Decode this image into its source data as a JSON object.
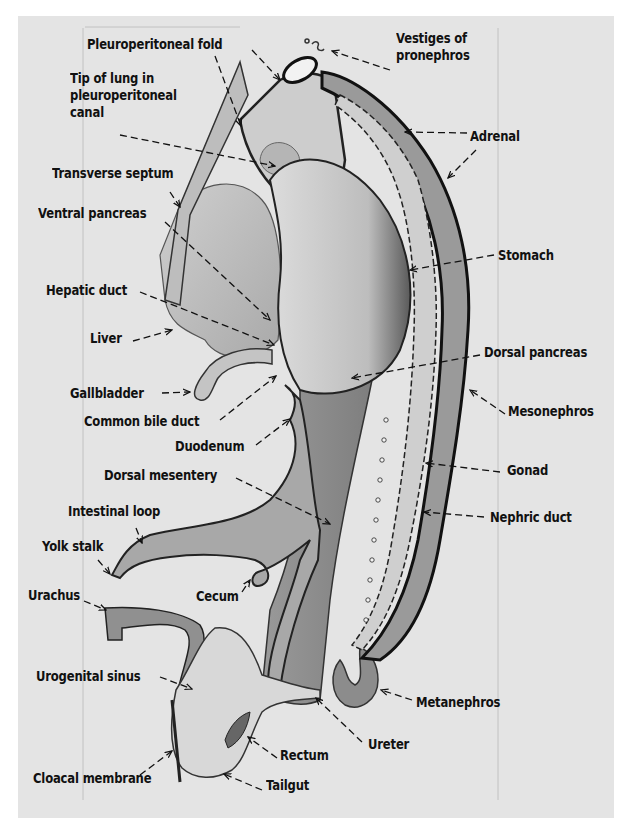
{
  "figure": {
    "background_color": "#e4e4e4",
    "ink_color": "#111111",
    "labels": [
      {
        "id": "pleuroperitoneal-fold",
        "text": "Pleuroperitoneal fold",
        "x": 87,
        "y": 36
      },
      {
        "id": "vestiges-of-pronephros",
        "text": "Vestiges of\npronephros",
        "x": 396,
        "y": 30
      },
      {
        "id": "tip-of-lung",
        "text": "Tip of lung in\npleuroperitoneal\ncanal",
        "x": 70,
        "y": 70
      },
      {
        "id": "adrenal",
        "text": "Adrenal",
        "x": 470,
        "y": 128
      },
      {
        "id": "transverse-septum",
        "text": "Transverse septum",
        "x": 52,
        "y": 165
      },
      {
        "id": "ventral-pancreas",
        "text": "Ventral pancreas",
        "x": 38,
        "y": 205
      },
      {
        "id": "stomach",
        "text": "Stomach",
        "x": 498,
        "y": 247
      },
      {
        "id": "hepatic-duct",
        "text": "Hepatic duct",
        "x": 46,
        "y": 282
      },
      {
        "id": "liver",
        "text": "Liver",
        "x": 90,
        "y": 330
      },
      {
        "id": "dorsal-pancreas",
        "text": "Dorsal pancreas",
        "x": 484,
        "y": 344
      },
      {
        "id": "gallbladder",
        "text": "Gallbladder",
        "x": 70,
        "y": 385
      },
      {
        "id": "mesonephros",
        "text": "Mesonephros",
        "x": 508,
        "y": 403
      },
      {
        "id": "common-bile-duct",
        "text": "Common bile duct",
        "x": 84,
        "y": 413
      },
      {
        "id": "duodenum",
        "text": "Duodenum",
        "x": 175,
        "y": 438
      },
      {
        "id": "gonad",
        "text": "Gonad",
        "x": 507,
        "y": 462
      },
      {
        "id": "dorsal-mesentery",
        "text": "Dorsal mesentery",
        "x": 104,
        "y": 467
      },
      {
        "id": "nephric-duct",
        "text": "Nephric duct",
        "x": 490,
        "y": 509
      },
      {
        "id": "intestinal-loop",
        "text": "Intestinal loop",
        "x": 68,
        "y": 503
      },
      {
        "id": "yolk-stalk",
        "text": "Yolk stalk",
        "x": 42,
        "y": 538
      },
      {
        "id": "urachus",
        "text": "Urachus",
        "x": 28,
        "y": 587
      },
      {
        "id": "cecum",
        "text": "Cecum",
        "x": 196,
        "y": 588
      },
      {
        "id": "urogenital-sinus",
        "text": "Urogenital sinus",
        "x": 36,
        "y": 668
      },
      {
        "id": "metanephros",
        "text": "Metanephros",
        "x": 416,
        "y": 694
      },
      {
        "id": "rectum",
        "text": "Rectum",
        "x": 280,
        "y": 747
      },
      {
        "id": "ureter",
        "text": "Ureter",
        "x": 368,
        "y": 736
      },
      {
        "id": "cloacal-membrane",
        "text": "Cloacal membrane",
        "x": 33,
        "y": 770
      },
      {
        "id": "tailgut",
        "text": "Tailgut",
        "x": 266,
        "y": 777
      }
    ],
    "leaders": [
      {
        "for": "pleuroperitoneal-fold",
        "x1": 252,
        "y1": 50,
        "x2": 280,
        "y2": 80
      },
      {
        "for": "pleuroperitoneal-fold-2",
        "x1": 215,
        "y1": 56,
        "x2": 241,
        "y2": 126
      },
      {
        "for": "vestiges-of-pronephros",
        "x1": 390,
        "y1": 70,
        "x2": 332,
        "y2": 51
      },
      {
        "for": "tip-of-lung",
        "x1": 120,
        "y1": 135,
        "x2": 275,
        "y2": 166
      },
      {
        "for": "adrenal",
        "x1": 467,
        "y1": 133,
        "x2": 405,
        "y2": 132
      },
      {
        "for": "adrenal-2",
        "x1": 476,
        "y1": 150,
        "x2": 448,
        "y2": 178
      },
      {
        "for": "transverse-septum",
        "x1": 170,
        "y1": 192,
        "x2": 180,
        "y2": 207
      },
      {
        "for": "ventral-pancreas",
        "x1": 165,
        "y1": 222,
        "x2": 270,
        "y2": 320
      },
      {
        "for": "stomach",
        "x1": 494,
        "y1": 255,
        "x2": 410,
        "y2": 270
      },
      {
        "for": "hepatic-duct",
        "x1": 140,
        "y1": 292,
        "x2": 274,
        "y2": 345
      },
      {
        "for": "liver",
        "x1": 133,
        "y1": 341,
        "x2": 172,
        "y2": 330
      },
      {
        "for": "dorsal-pancreas",
        "x1": 480,
        "y1": 355,
        "x2": 352,
        "y2": 378
      },
      {
        "for": "gallbladder",
        "x1": 162,
        "y1": 393,
        "x2": 190,
        "y2": 392
      },
      {
        "for": "mesonephros",
        "x1": 505,
        "y1": 414,
        "x2": 470,
        "y2": 390
      },
      {
        "for": "common-bile-duct",
        "x1": 220,
        "y1": 420,
        "x2": 276,
        "y2": 376
      },
      {
        "for": "duodenum",
        "x1": 256,
        "y1": 445,
        "x2": 290,
        "y2": 419
      },
      {
        "for": "gonad",
        "x1": 500,
        "y1": 472,
        "x2": 426,
        "y2": 463
      },
      {
        "for": "dorsal-mesentery",
        "x1": 236,
        "y1": 478,
        "x2": 330,
        "y2": 524
      },
      {
        "for": "nephric-duct",
        "x1": 484,
        "y1": 517,
        "x2": 424,
        "y2": 512
      },
      {
        "for": "intestinal-loop",
        "x1": 136,
        "y1": 528,
        "x2": 142,
        "y2": 543
      },
      {
        "for": "yolk-stalk",
        "x1": 98,
        "y1": 560,
        "x2": 110,
        "y2": 574
      },
      {
        "for": "urachus",
        "x1": 84,
        "y1": 601,
        "x2": 106,
        "y2": 610
      },
      {
        "for": "cecum",
        "x1": 242,
        "y1": 592,
        "x2": 250,
        "y2": 580
      },
      {
        "for": "urogenital-sinus",
        "x1": 160,
        "y1": 677,
        "x2": 192,
        "y2": 689
      },
      {
        "for": "metanephros",
        "x1": 412,
        "y1": 700,
        "x2": 381,
        "y2": 690
      },
      {
        "for": "rectum",
        "x1": 277,
        "y1": 758,
        "x2": 248,
        "y2": 737
      },
      {
        "for": "ureter",
        "x1": 362,
        "y1": 742,
        "x2": 316,
        "y2": 698
      },
      {
        "for": "cloacal-membrane",
        "x1": 140,
        "y1": 775,
        "x2": 172,
        "y2": 751
      },
      {
        "for": "tailgut",
        "x1": 262,
        "y1": 790,
        "x2": 224,
        "y2": 774
      }
    ]
  }
}
